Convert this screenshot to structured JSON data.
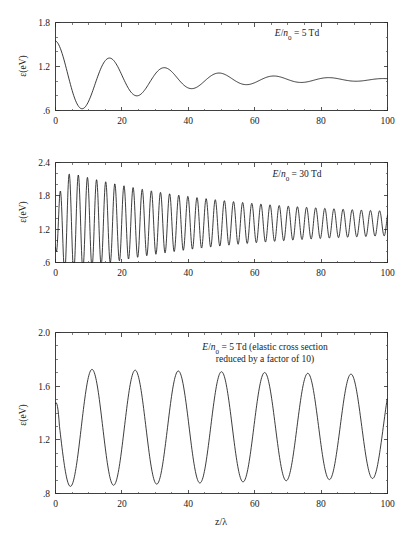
{
  "figure": {
    "background": "#ffffff",
    "line_color": "#1a1a1a",
    "axis_color": "#2b2b2b",
    "xlabel": "z/λ",
    "ylabel": "ε(eV)"
  },
  "panels": [
    {
      "id": "panel-1",
      "annotation_lines": [
        "E/n0 = 5 Td"
      ],
      "annotation_html": "<tspan class=\"it\">E</tspan>/<tspan class=\"it\">n</tspan><tspan baseline-shift=\"sub\" font-size=\"7\">0</tspan> = 5 Td",
      "ylabel": "ε(eV)",
      "y_ticks": [
        "1.8",
        "1.2",
        ".6"
      ],
      "y_tick_values": [
        1.8,
        1.2,
        0.6
      ],
      "x_ticks": [
        "0",
        "20",
        "40",
        "60",
        "80",
        "100"
      ],
      "x_tick_values": [
        0,
        20,
        40,
        60,
        80,
        100
      ],
      "ylim": [
        0.6,
        1.8
      ],
      "xlim": [
        0,
        100
      ]
    },
    {
      "id": "panel-2",
      "annotation_lines": [
        "E/n0 = 30 Td"
      ],
      "annotation_html": "<tspan class=\"it\">E</tspan>/<tspan class=\"it\">n</tspan><tspan baseline-shift=\"sub\" font-size=\"7\">0</tspan> = 30 Td",
      "ylabel": "ε(eV)",
      "y_ticks": [
        "2.4",
        "1.8",
        "1.2",
        ".6"
      ],
      "y_tick_values": [
        2.4,
        1.8,
        1.2,
        0.6
      ],
      "x_ticks": [
        "0",
        "20",
        "40",
        "60",
        "80",
        "100"
      ],
      "x_tick_values": [
        0,
        20,
        40,
        60,
        80,
        100
      ],
      "ylim": [
        0.6,
        2.4
      ],
      "xlim": [
        0,
        100
      ]
    },
    {
      "id": "panel-3",
      "annotation_lines": [
        "E/n0 = 5 Td (elastic cross section",
        "reduced by a factor of 10)"
      ],
      "annotation_html": "<tspan class=\"it\">E</tspan>/<tspan class=\"it\">n</tspan><tspan baseline-shift=\"sub\" font-size=\"7\">0</tspan> = 5 Td (elastic cross section",
      "annotation_html2": "reduced by a factor of 10)",
      "ylabel": "ε(eV)",
      "y_ticks": [
        "2.0",
        "1.6",
        "1.2",
        ".8"
      ],
      "y_tick_values": [
        2.0,
        1.6,
        1.2,
        0.8
      ],
      "x_ticks": [
        "0",
        "20",
        "40",
        "60",
        "80",
        "100"
      ],
      "x_tick_values": [
        0,
        20,
        40,
        60,
        80,
        100
      ],
      "xlabel": "z/λ",
      "ylim": [
        0.8,
        2.0
      ],
      "xlim": [
        0,
        100
      ]
    }
  ],
  "chart_data": [
    {
      "type": "line",
      "title": "",
      "panel": "panel-1",
      "annotation": "E/n0 = 5 Td",
      "xlabel": "",
      "ylabel": "ε(eV)",
      "xlim": [
        0,
        100
      ],
      "ylim": [
        0.6,
        1.8
      ],
      "grid": false,
      "legend": "none",
      "description": "Damped oscillation of mean electron energy vs z/lambda, relaxing toward ~1.02 eV",
      "model": {
        "equilibrium": 1.02,
        "initial_value": 1.55,
        "amplitude0": 0.53,
        "damping_length": 28,
        "period": 16.5,
        "phase_deg": 0
      },
      "x": [
        0,
        2,
        4,
        6,
        8,
        10,
        12,
        14,
        16,
        17,
        18,
        20,
        22,
        24,
        25,
        26,
        28,
        30,
        32,
        33,
        34,
        36,
        38,
        40,
        41,
        42,
        44,
        46,
        48,
        50,
        52,
        54,
        56,
        58,
        60,
        62,
        64,
        66,
        68,
        70,
        72,
        74,
        76,
        78,
        80,
        82,
        84,
        86,
        88,
        90,
        92,
        94,
        96,
        98,
        100
      ],
      "y": [
        1.55,
        1.47,
        1.25,
        0.95,
        0.71,
        0.66,
        0.72,
        0.9,
        1.15,
        1.24,
        1.25,
        1.15,
        0.95,
        0.82,
        0.79,
        0.8,
        0.88,
        1.02,
        1.13,
        1.15,
        1.15,
        1.08,
        0.96,
        0.89,
        0.88,
        0.88,
        0.93,
        1.02,
        1.09,
        1.11,
        1.08,
        1.01,
        0.96,
        0.94,
        0.95,
        0.99,
        1.04,
        1.07,
        1.06,
        1.02,
        0.99,
        0.98,
        0.99,
        1.02,
        1.05,
        1.06,
        1.05,
        1.02,
        1.0,
        1.0,
        1.01,
        1.03,
        1.05,
        1.05,
        1.04
      ]
    },
    {
      "type": "line",
      "title": "",
      "panel": "panel-2",
      "annotation": "E/n0 = 30 Td",
      "xlabel": "",
      "ylabel": "ε(eV)",
      "xlim": [
        0,
        100
      ],
      "ylim": [
        0.6,
        2.4
      ],
      "grid": false,
      "legend": "none",
      "description": "Rapid damped oscillation, ~36 cycles over z/lambda 0-100, peak 2.28 near z=2, relaxing to band 1.18-1.44",
      "model": {
        "equilibrium_start": 1.32,
        "equilibrium_end": 1.3,
        "amplitude0": 0.98,
        "amplitude_end": 0.13,
        "damping_length": 45,
        "period": 2.75,
        "initial_value": 0.82
      },
      "peaks_envelope": [
        [
          2,
          2.28
        ],
        [
          10,
          2.02
        ],
        [
          20,
          1.85
        ],
        [
          30,
          1.72
        ],
        [
          40,
          1.62
        ],
        [
          50,
          1.55
        ],
        [
          60,
          1.5
        ],
        [
          70,
          1.47
        ],
        [
          80,
          1.45
        ],
        [
          90,
          1.44
        ],
        [
          100,
          1.43
        ]
      ],
      "troughs_envelope": [
        [
          3.5,
          0.72
        ],
        [
          10,
          0.85
        ],
        [
          20,
          0.95
        ],
        [
          30,
          1.02
        ],
        [
          40,
          1.08
        ],
        [
          50,
          1.12
        ],
        [
          60,
          1.15
        ],
        [
          70,
          1.17
        ],
        [
          80,
          1.18
        ],
        [
          90,
          1.19
        ],
        [
          100,
          1.2
        ]
      ]
    },
    {
      "type": "line",
      "title": "",
      "panel": "panel-3",
      "annotation": "E/n0 = 5 Td (elastic cross section reduced by a factor of 10)",
      "xlabel": "z/λ",
      "ylabel": "ε(eV)",
      "xlim": [
        0,
        100
      ],
      "ylim": [
        0.8,
        2.0
      ],
      "grid": false,
      "legend": "none",
      "description": "Nearly undamped oscillation, period ~13, 8 peaks visible; peaks decay slowly from 1.73 to 1.65, troughs rise from 0.86 to 0.89",
      "model": {
        "equilibrium": 1.29,
        "amplitude0": 0.44,
        "amplitude_end": 0.385,
        "period": 13.0,
        "initial_value": 1.47,
        "first_peak_x": 11
      },
      "peaks": [
        [
          11,
          1.73
        ],
        [
          24,
          1.725
        ],
        [
          37,
          1.715
        ],
        [
          50,
          1.7
        ],
        [
          63,
          1.69
        ],
        [
          76,
          1.675
        ],
        [
          89,
          1.66
        ]
      ],
      "troughs": [
        [
          4,
          0.865
        ],
        [
          17,
          0.855
        ],
        [
          30,
          0.86
        ],
        [
          43,
          0.865
        ],
        [
          56,
          0.875
        ],
        [
          69,
          0.88
        ],
        [
          82,
          0.885
        ],
        [
          95,
          0.89
        ]
      ]
    }
  ]
}
